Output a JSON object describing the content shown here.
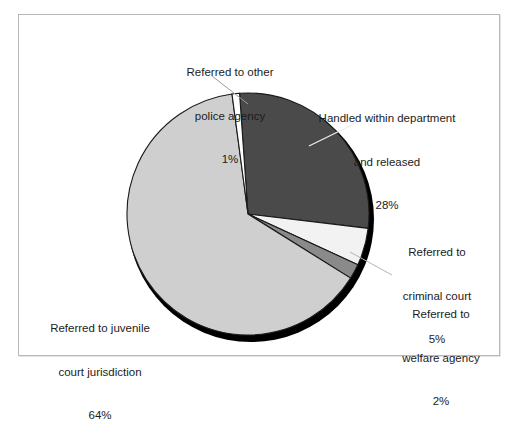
{
  "figure": {
    "background_color": "#ffffff",
    "frame_border_color": "#b9b9b9"
  },
  "chart_data": {
    "type": "pie",
    "title": "",
    "subtitle": "",
    "xlabel": "",
    "ylabel": "",
    "legend_position": "none",
    "grid": false,
    "labels_outside": true,
    "start_angle_deg": -4,
    "direction": "clockwise",
    "categories": [
      "Handled within department and released",
      "Referred to criminal court",
      "Referred to welfare agency",
      "Referred to juvenile court jurisdiction",
      "Referred to other police agency"
    ],
    "values": [
      28,
      5,
      2,
      64,
      1
    ],
    "value_suffix": "%",
    "colors": [
      "#4a4a4a",
      "#f2f2f2",
      "#8a8a8a",
      "#cfcfcf",
      "#ffffff"
    ],
    "slice_edge_color": "#1a1a1a",
    "shadow_color": "#000000",
    "slices": [
      {
        "name": "handled-within-department",
        "label_lines": [
          "Handled within department",
          "and released"
        ],
        "value_text": "28%",
        "value": 28,
        "color": "#4a4a4a"
      },
      {
        "name": "referred-criminal-court",
        "label_lines": [
          "Referred to",
          "criminal court"
        ],
        "value_text": "5%",
        "value": 5,
        "color": "#f2f2f2"
      },
      {
        "name": "referred-welfare-agency",
        "label_lines": [
          "Referred to",
          "welfare agency"
        ],
        "value_text": "2%",
        "value": 2,
        "color": "#8a8a8a"
      },
      {
        "name": "referred-juvenile-court",
        "label_lines": [
          "Referred to juvenile",
          "court jurisdiction"
        ],
        "value_text": "64%",
        "value": 64,
        "color": "#cfcfcf"
      },
      {
        "name": "referred-other-police-agency",
        "label_lines": [
          "Referred to other",
          "police agency"
        ],
        "value_text": "1%",
        "value": 1,
        "color": "#ffffff"
      }
    ]
  },
  "labels": {
    "other_police": {
      "line1": "Referred to other",
      "line2": "police agency",
      "value": "1%"
    },
    "handled": {
      "line1": "Handled within department",
      "line2": "and released",
      "value": "28%"
    },
    "criminal_court": {
      "line1": "Referred to",
      "line2": "criminal court",
      "value": "5%"
    },
    "welfare_agency": {
      "line1": "Referred to",
      "line2": "welfare agency",
      "value": "2%"
    },
    "juvenile_court": {
      "line1": "Referred to juvenile",
      "line2": "court jurisdiction",
      "value": "64%"
    }
  }
}
